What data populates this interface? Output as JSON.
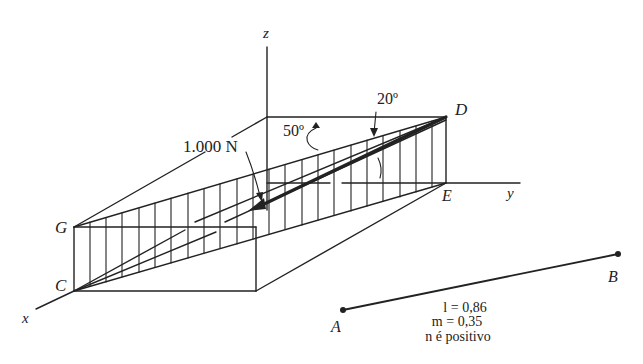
{
  "figure": {
    "axes": {
      "x_label": "x",
      "y_label": "y",
      "z_label": "z"
    },
    "points": {
      "C": "C",
      "G": "G",
      "D": "D",
      "E": "E",
      "A": "A",
      "B": "B"
    },
    "annotations": {
      "force": "1.000 N",
      "angle_50": "50º",
      "angle_20": "20º"
    },
    "direction_cosines": {
      "l": "l = 0,86",
      "m": "m = 0,35",
      "n": "n  é positivo"
    },
    "colors": {
      "ink": "#222222",
      "background": "#ffffff"
    }
  }
}
